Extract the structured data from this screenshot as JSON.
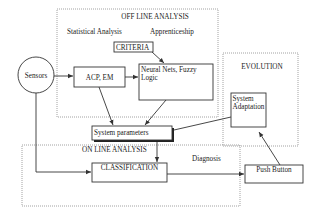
{
  "diagram": {
    "regions": {
      "offline": {
        "title": "OFF LINE ANALYSIS",
        "left_label": "Statistical Analysis",
        "right_label": "Apprenticeship"
      },
      "online": {
        "title": "ON LINE ANALYSIS",
        "side_label": "Diagnosis"
      },
      "evolution": {
        "title": "EVOLUTION"
      }
    },
    "nodes": {
      "sensors": "Sensors",
      "criteria": "CRITERIA",
      "acp_em": "ACP, EM",
      "neural_line1": "Neural Nets, Fuzzy",
      "neural_line2": "Logic",
      "system_parameters": "System parameters",
      "system_adaptation_line1": "System",
      "system_adaptation_line2": "Adaptation",
      "classification": "CLASSIFICATION",
      "push_button": "Push Button"
    },
    "edges": [
      {
        "from": "Sensors",
        "to": "ACP, EM"
      },
      {
        "from": "CRITERIA",
        "to": "Neural Nets, Fuzzy Logic"
      },
      {
        "from": "ACP, EM",
        "to": "Neural Nets, Fuzzy Logic"
      },
      {
        "from": "ACP, EM",
        "to": "System parameters"
      },
      {
        "from": "Neural Nets, Fuzzy Logic",
        "to": "System parameters"
      },
      {
        "from": "System Adaptation",
        "to": "System parameters"
      },
      {
        "from": "System parameters",
        "to": "CLASSIFICATION"
      },
      {
        "from": "Sensors",
        "to": "CLASSIFICATION"
      },
      {
        "from": "CLASSIFICATION",
        "to": "Push Button"
      },
      {
        "from": "Push Button",
        "to": "System Adaptation"
      }
    ]
  }
}
